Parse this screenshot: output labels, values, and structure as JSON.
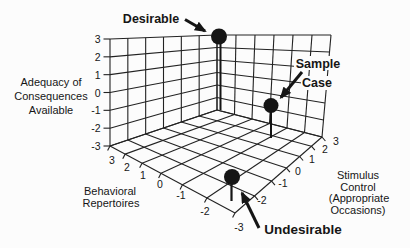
{
  "figure": {
    "background": "#fcfcfc",
    "ink_color": "#222222",
    "text_color": "#161616"
  },
  "chart_data": {
    "type": "scatter",
    "projection": "3d-drop-line",
    "grid": true,
    "axes": {
      "adequacy": {
        "label_lines": [
          "Adequacy of",
          "Consequences",
          "Available"
        ],
        "ticks": [
          "3",
          "2",
          "1",
          "0",
          "-1",
          "-2",
          "-3"
        ],
        "range": [
          -3,
          3
        ]
      },
      "behavioral": {
        "label_lines": [
          "Behavioral",
          "Repertoires"
        ],
        "ticks": [
          "3",
          "2",
          "1",
          "0",
          "-1",
          "-2",
          "-3"
        ],
        "range": [
          -3,
          3
        ]
      },
      "stimulus": {
        "label_lines": [
          "Stimulus",
          "Control",
          "(Appropriate",
          "Occasions)"
        ],
        "ticks": [
          "-2",
          "-1",
          "0",
          "1",
          "2",
          "3"
        ],
        "range": [
          -3,
          3
        ]
      }
    },
    "points": [
      {
        "label": "Desirable",
        "behavioral_repertoires": 3,
        "stimulus_control": 3,
        "adequacy_of_consequences": 3
      },
      {
        "label": "Sample Case",
        "behavioral_repertoires": -1,
        "stimulus_control": 2,
        "adequacy_of_consequences": -1
      },
      {
        "label": "Undesirable",
        "behavioral_repertoires": -2.5,
        "stimulus_control": -2.5,
        "adequacy_of_consequences": -2
      }
    ]
  },
  "annotations": {
    "desirable": "Desirable",
    "sample_case_line1": "Sample",
    "sample_case_line2": "Case",
    "undesirable": "Undesirable"
  }
}
